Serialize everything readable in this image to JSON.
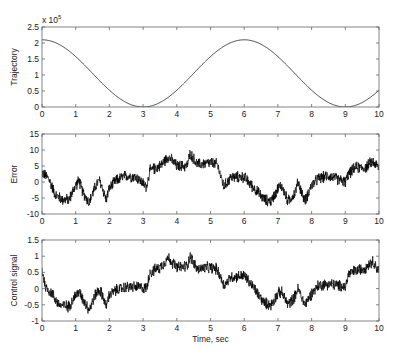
{
  "chart_data": [
    {
      "type": "line",
      "title": "",
      "xlabel": "",
      "ylabel": "Trajectory",
      "y_multiplier_label": "x 10",
      "y_multiplier_exp": "5",
      "xlim": [
        0,
        10
      ],
      "ylim": [
        0,
        2.5
      ],
      "xticks": [
        0,
        1,
        2,
        3,
        4,
        5,
        6,
        7,
        8,
        9,
        10
      ],
      "yticks": [
        0,
        0.5,
        1,
        1.5,
        2,
        2.5
      ],
      "ytick_labels": [
        "0",
        "0.5",
        "1",
        "1.5",
        "2",
        "2.5"
      ],
      "grid": false,
      "series": [
        {
          "name": "trajectory",
          "description": "Smooth cosine-like curve: starts at 2.1 (x1e5) at t=0, minimum 0 near t=3.0, max 2.1 near t=6.0, minimum 0 near t=9.0, rising to ~0.35 at t=10",
          "x": [
            0,
            0.5,
            1,
            1.5,
            2,
            2.5,
            3,
            3.5,
            4,
            4.5,
            5,
            5.5,
            6,
            6.5,
            7,
            7.5,
            8,
            8.5,
            9,
            9.5,
            10
          ],
          "values": [
            2.1,
            2.03,
            1.82,
            1.5,
            1.05,
            0.55,
            0.05,
            0.12,
            0.55,
            1.05,
            1.55,
            1.92,
            2.1,
            2.03,
            1.8,
            1.4,
            0.9,
            0.4,
            0.02,
            0.1,
            0.35
          ]
        }
      ]
    },
    {
      "type": "line",
      "title": "",
      "xlabel": "",
      "ylabel": "Error",
      "xlim": [
        0,
        10
      ],
      "ylim": [
        -10,
        15
      ],
      "xticks": [
        0,
        1,
        2,
        3,
        4,
        5,
        6,
        7,
        8,
        9,
        10
      ],
      "yticks": [
        -10,
        -5,
        0,
        5,
        10,
        15
      ],
      "ytick_labels": [
        "-10",
        "-5",
        "0",
        "5",
        "10",
        "15"
      ],
      "grid": false,
      "series": [
        {
          "name": "error",
          "description": "Noisy signal (envelope center values)",
          "x": [
            0,
            0.2,
            0.4,
            0.6,
            0.8,
            1.0,
            1.1,
            1.2,
            1.4,
            1.6,
            1.7,
            1.8,
            1.9,
            2.0,
            2.2,
            2.5,
            2.8,
            3.1,
            3.2,
            3.5,
            3.75,
            4.0,
            4.3,
            4.4,
            4.6,
            5.0,
            5.2,
            5.4,
            5.6,
            6.0,
            6.3,
            6.6,
            6.8,
            7.0,
            7.1,
            7.3,
            7.5,
            7.6,
            7.8,
            8.0,
            8.2,
            8.5,
            9.0,
            9.1,
            9.3,
            9.6,
            9.8,
            10.0
          ],
          "values": [
            3,
            1,
            -4,
            -5.5,
            -5.5,
            -1,
            0.5,
            -3,
            -6.5,
            -1,
            0.5,
            -2,
            -5.5,
            -2,
            0.5,
            2,
            1.5,
            -1.5,
            3.5,
            5,
            8,
            5,
            5,
            9,
            5.5,
            6,
            5.5,
            -1.5,
            1.5,
            1.5,
            -2,
            -5.5,
            -6,
            -2,
            -1,
            -6,
            -3.5,
            0,
            -6,
            -1,
            1,
            2,
            0,
            2.5,
            4.5,
            4.5,
            6.5,
            4.5
          ]
        }
      ]
    },
    {
      "type": "line",
      "title": "",
      "xlabel": "Time, sec",
      "ylabel": "Control signal",
      "xlim": [
        0,
        10
      ],
      "ylim": [
        -1,
        1.5
      ],
      "xticks": [
        0,
        1,
        2,
        3,
        4,
        5,
        6,
        7,
        8,
        9,
        10
      ],
      "yticks": [
        -1,
        -0.5,
        0,
        0.5,
        1,
        1.5
      ],
      "ytick_labels": [
        "-1",
        "-0.5",
        "0",
        "0.5",
        "1",
        "1.5"
      ],
      "grid": false,
      "series": [
        {
          "name": "control_signal",
          "description": "Noisy signal (envelope center values)",
          "x": [
            0,
            0.1,
            0.3,
            0.5,
            0.8,
            1.0,
            1.1,
            1.2,
            1.4,
            1.6,
            1.7,
            1.8,
            1.9,
            2.0,
            2.2,
            2.5,
            2.8,
            3.1,
            3.2,
            3.5,
            3.75,
            4.0,
            4.3,
            4.4,
            4.6,
            5.0,
            5.2,
            5.4,
            5.6,
            6.0,
            6.3,
            6.6,
            6.8,
            7.0,
            7.1,
            7.3,
            7.5,
            7.6,
            7.8,
            8.0,
            8.2,
            8.5,
            9.0,
            9.1,
            9.3,
            9.6,
            9.8,
            10.0
          ],
          "values": [
            0.6,
            0.05,
            -0.15,
            -0.5,
            -0.55,
            -0.2,
            -0.1,
            -0.3,
            -0.65,
            -0.15,
            -0.05,
            -0.2,
            -0.55,
            -0.2,
            -0.05,
            0.05,
            0.05,
            0.0,
            0.5,
            0.65,
            0.95,
            0.65,
            0.7,
            1.0,
            0.6,
            0.65,
            0.6,
            0.1,
            0.35,
            0.4,
            0.0,
            -0.45,
            -0.5,
            -0.15,
            -0.1,
            -0.5,
            -0.25,
            0.0,
            -0.5,
            -0.15,
            0.1,
            0.15,
            0.05,
            0.45,
            0.55,
            0.65,
            0.85,
            0.55
          ]
        }
      ]
    }
  ]
}
